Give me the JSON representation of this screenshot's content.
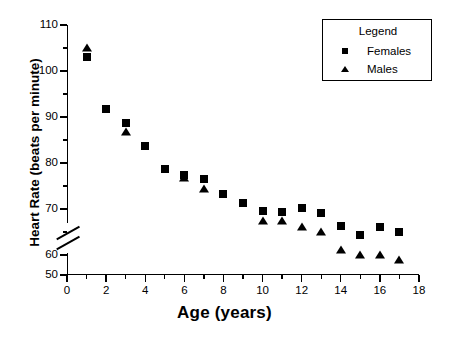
{
  "chart_data": {
    "type": "scatter",
    "title": "",
    "xlabel": "Age (years)",
    "ylabel": "Heart Rate (beats per minute)",
    "xlim": [
      0,
      18
    ],
    "ylim": [
      50,
      110
    ],
    "axis_break": {
      "present": true,
      "between": [
        50,
        60
      ],
      "axis": "y"
    },
    "grid": false,
    "legend": {
      "title": "Legend",
      "position": "top-right",
      "entries": [
        {
          "label": "Females",
          "marker": "square"
        },
        {
          "label": "Males",
          "marker": "triangle"
        }
      ]
    },
    "xticks": [
      0,
      2,
      4,
      6,
      8,
      10,
      12,
      14,
      16,
      18
    ],
    "xtick_labels": [
      "0",
      "2",
      "4",
      "6",
      "8",
      "10",
      "12",
      "14",
      "16",
      "18"
    ],
    "xminor_ticks": [
      1,
      3,
      5,
      7,
      9,
      11,
      13,
      15,
      17
    ],
    "yticks": [
      50,
      60,
      70,
      80,
      90,
      100,
      110
    ],
    "ytick_labels": [
      "50",
      "60",
      "70",
      "80",
      "90",
      "100",
      "110"
    ],
    "yminor_ticks": [
      65,
      75,
      85,
      95,
      105
    ],
    "x": [
      1,
      2,
      3,
      4,
      5,
      6,
      7,
      8,
      9,
      10,
      11,
      12,
      13,
      14,
      15,
      16,
      17
    ],
    "series": [
      {
        "name": "Females",
        "marker": "square",
        "color": "#000000",
        "x": [
          1,
          2,
          3,
          4,
          5,
          6,
          7,
          8,
          9,
          10,
          11,
          12,
          13,
          14,
          15,
          16,
          17
        ],
        "values": [
          103.0,
          91.8,
          88.8,
          83.6,
          78.6,
          77.3,
          76.5,
          73.3,
          71.3,
          69.5,
          69.3,
          70.2,
          69.2,
          66.2,
          64.3,
          66.1,
          65.1
        ]
      },
      {
        "name": "Males",
        "marker": "triangle",
        "color": "#000000",
        "x": [
          1,
          3,
          6,
          7,
          10,
          11,
          12,
          13,
          14,
          15,
          16,
          17
        ],
        "values": [
          105.0,
          86.8,
          76.8,
          74.4,
          67.3,
          67.3,
          66.1,
          65.0,
          61.0,
          60.0,
          59.9,
          58.9
        ]
      }
    ]
  },
  "axis": {
    "xlabel": "Age (years)",
    "ylabel": "Heart Rate (beats per minute)"
  },
  "legend": {
    "title": "Legend",
    "females": "Females",
    "males": "Males"
  }
}
